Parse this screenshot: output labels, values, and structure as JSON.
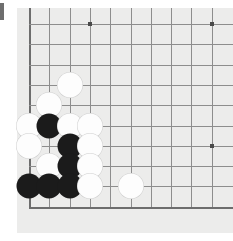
{
  "app": {
    "title": "Go Board Position",
    "type": "go-board-diagram"
  },
  "marker": {
    "name": "left-edge-marker",
    "color": "#6e6e6e"
  },
  "board": {
    "background_color": "#ececeb",
    "line_color": "#8d8d8d",
    "edge_line_color": "#6d6d6d",
    "grid_origin_x": 12,
    "grid_origin_y": 16,
    "grid_spacing": 20.3,
    "columns": 10,
    "rows": 10,
    "corner": "bottom-left",
    "hoshi_color": "#4a4a4a",
    "hoshi_points": [
      {
        "col": 3,
        "row": 0
      },
      {
        "col": 9,
        "row": 0
      },
      {
        "col": 9,
        "row": 6
      }
    ],
    "edges": {
      "left": true,
      "bottom": true,
      "top": false,
      "right": false
    }
  },
  "stones": {
    "black_color": "#1b1b1b",
    "white_color": "#fdfdfd",
    "diameter": 25,
    "black_count": 8,
    "white_count": 12,
    "list": [
      {
        "color": "white",
        "col": 2,
        "row": 3
      },
      {
        "color": "white",
        "col": 1,
        "row": 4
      },
      {
        "color": "white",
        "col": 0,
        "row": 5
      },
      {
        "color": "black",
        "col": 1,
        "row": 5
      },
      {
        "color": "white",
        "col": 2,
        "row": 5
      },
      {
        "color": "white",
        "col": 3,
        "row": 5
      },
      {
        "color": "white",
        "col": 0,
        "row": 6
      },
      {
        "color": "black",
        "col": 2,
        "row": 6
      },
      {
        "color": "white",
        "col": 3,
        "row": 6
      },
      {
        "color": "white",
        "col": 1,
        "row": 7
      },
      {
        "color": "black",
        "col": 2,
        "row": 7
      },
      {
        "color": "white",
        "col": 3,
        "row": 7
      },
      {
        "color": "black",
        "col": 0,
        "row": 8
      },
      {
        "color": "black",
        "col": 1,
        "row": 8
      },
      {
        "color": "black",
        "col": 2,
        "row": 8
      },
      {
        "color": "white",
        "col": 3,
        "row": 8
      },
      {
        "color": "white",
        "col": 5,
        "row": 8
      }
    ]
  }
}
